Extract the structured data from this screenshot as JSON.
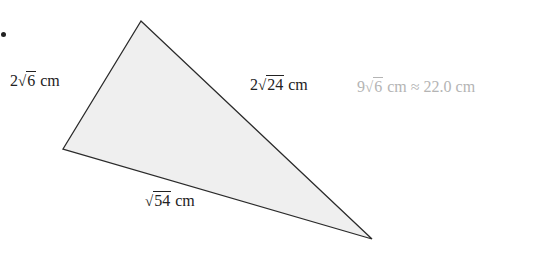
{
  "figure": {
    "type": "triangle",
    "fill": "#efefef",
    "stroke": "#2a2a2a",
    "vertices": {
      "top": [
        141,
        21
      ],
      "left": [
        63,
        149
      ],
      "bottom_right": [
        372,
        239
      ]
    },
    "sides": {
      "left": {
        "coef": "2",
        "radicand": "6",
        "unit": "cm"
      },
      "right": {
        "coef": "2",
        "radicand": "24",
        "unit": "cm"
      },
      "bottom": {
        "coef": "",
        "radicand": "54",
        "unit": "cm"
      }
    },
    "perimeter": {
      "coef": "9",
      "radicand": "6",
      "unit": "cm",
      "approx_sign": "≈",
      "approx_value": "22.0 cm"
    },
    "perimeter_color": "#b4b4b4"
  },
  "glyphs": {
    "radical": "√"
  }
}
